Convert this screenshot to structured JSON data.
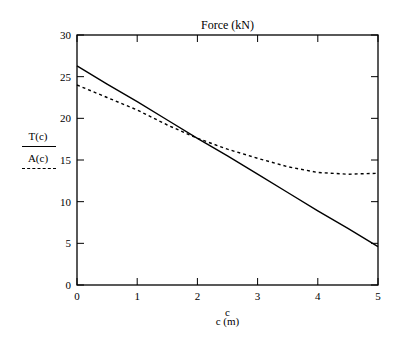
{
  "chart_data": {
    "type": "line",
    "title": "Force (kN)",
    "xlabel": "c (m)",
    "xvar": "c",
    "ylabel": "",
    "xlim": [
      0,
      5
    ],
    "ylim": [
      0,
      30
    ],
    "x_ticks": [
      0,
      1,
      2,
      3,
      4,
      5
    ],
    "y_ticks": [
      0,
      5,
      10,
      15,
      20,
      25,
      30
    ],
    "grid": false,
    "legend_position": "left",
    "x": [
      0,
      0.5,
      1,
      1.5,
      2,
      2.5,
      3,
      3.5,
      4,
      4.5,
      5
    ],
    "series": [
      {
        "name": "T(c)",
        "style": "solid",
        "values": [
          26.3,
          24.1,
          22.0,
          19.8,
          17.6,
          15.5,
          13.3,
          11.1,
          8.9,
          6.8,
          4.6
        ]
      },
      {
        "name": "A(c)",
        "style": "dashed",
        "values": [
          24.0,
          22.5,
          21.0,
          19.2,
          17.6,
          16.3,
          15.2,
          14.2,
          13.5,
          13.3,
          13.4
        ]
      }
    ]
  }
}
